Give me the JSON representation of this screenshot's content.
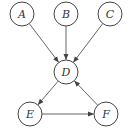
{
  "diagram": {
    "type": "directed-graph",
    "nodes": [
      {
        "id": "A",
        "label": "A",
        "x": 22,
        "y": 14
      },
      {
        "id": "B",
        "label": "B",
        "x": 66,
        "y": 14
      },
      {
        "id": "C",
        "label": "C",
        "x": 110,
        "y": 14
      },
      {
        "id": "D",
        "label": "D",
        "x": 66,
        "y": 72
      },
      {
        "id": "E",
        "label": "E",
        "x": 30,
        "y": 114
      },
      {
        "id": "F",
        "label": "F",
        "x": 106,
        "y": 114
      }
    ],
    "edges": [
      {
        "from": "A",
        "to": "D"
      },
      {
        "from": "B",
        "to": "D"
      },
      {
        "from": "C",
        "to": "D"
      },
      {
        "from": "D",
        "to": "E"
      },
      {
        "from": "E",
        "to": "F"
      },
      {
        "from": "F",
        "to": "D"
      }
    ],
    "colors": {
      "stroke": "#444444",
      "background": "#ffffff"
    }
  }
}
